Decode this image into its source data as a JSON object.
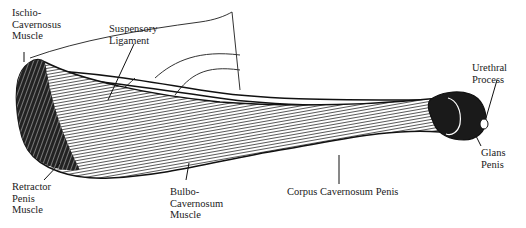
{
  "diagram": {
    "labels": {
      "ischio": {
        "lines": [
          "Ischio-",
          "Cavernosus",
          "Muscle"
        ]
      },
      "suspensory": {
        "lines": [
          "Suspensory",
          "Ligament"
        ]
      },
      "urethral": {
        "lines": [
          "Urethral",
          "Process"
        ]
      },
      "glans": {
        "lines": [
          "Glans",
          "Penis"
        ]
      },
      "retractor": {
        "lines": [
          "Retractor",
          "Penis",
          "Muscle"
        ]
      },
      "bulbo": {
        "lines": [
          "Bulbo-",
          "Cavernosum",
          "Muscle"
        ]
      },
      "corpus": {
        "lines": [
          "Corpus Cavernosum Penis"
        ]
      }
    },
    "colors": {
      "ink": "#111111",
      "paper": "#ffffff"
    }
  }
}
